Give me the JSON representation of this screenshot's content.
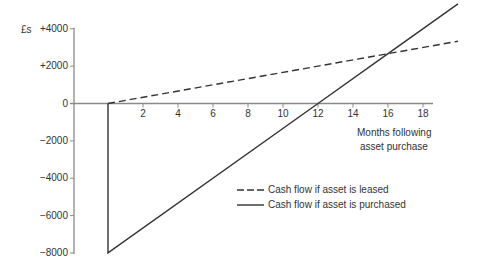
{
  "chart_data": {
    "type": "line",
    "title": "",
    "ylabel": "£s",
    "xlabel": "Months following asset purchase",
    "xlabel_lines": [
      "Months following",
      "asset purchase"
    ],
    "x_ticks": [
      2,
      4,
      6,
      8,
      10,
      12,
      14,
      16,
      18
    ],
    "x_tick_labels": [
      "2",
      "4",
      "6",
      "8",
      "10",
      "12",
      "14",
      "16",
      "18"
    ],
    "y_ticks": [
      4000,
      2000,
      0,
      -2000,
      -4000,
      -6000,
      -8000
    ],
    "y_tick_labels": [
      "+4000",
      "+2000",
      "0",
      "−2000",
      "−4000",
      "−6000",
      "−8000"
    ],
    "xlim": [
      0,
      20
    ],
    "ylim": [
      -8000,
      5400
    ],
    "grid": false,
    "legend_position": "lower right",
    "series": [
      {
        "name": "Cash flow if asset is leased",
        "style": "dashed",
        "color": "#333333",
        "points": [
          [
            0,
            0
          ],
          [
            16,
            2667
          ],
          [
            20,
            3333
          ]
        ]
      },
      {
        "name": "Cash flow if asset is purchased",
        "style": "solid",
        "color": "#333333",
        "points": [
          [
            0,
            0
          ],
          [
            0,
            -8000
          ],
          [
            12,
            0
          ],
          [
            16,
            2667
          ],
          [
            20,
            5333
          ]
        ]
      }
    ],
    "annotations": [
      "Lines intersect at month 16 (≈ +£2,667)",
      "Purchased line crosses zero at month 12"
    ]
  },
  "labels": {
    "currency": "£s",
    "xlabel_line1": "Months following",
    "xlabel_line2": "asset purchase",
    "legend_leased": "Cash flow if asset is leased",
    "legend_purchased": "Cash flow if asset is purchased"
  }
}
